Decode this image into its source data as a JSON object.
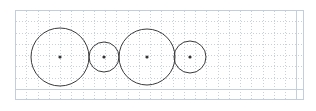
{
  "figure": {
    "title": "",
    "background_color": "#ffffff",
    "plot_area": {
      "x": 15,
      "y": 10,
      "width": 288,
      "height": 89
    }
  },
  "grid": {
    "visible": true,
    "style": "dotted",
    "color": "#b9c6d6",
    "border_color": "#c3cedc",
    "spacing": 11.25,
    "line_width": 1
  },
  "chart_data": {
    "type": "scatter",
    "title": "",
    "xlabel": "",
    "ylabel": "",
    "grid": true,
    "legend_position": "none",
    "xlim": [
      0,
      25.6
    ],
    "ylim": [
      0,
      7.9
    ],
    "circles": [
      {
        "name": "circle-1",
        "cx": 60,
        "cy": 57,
        "r": 29,
        "grid_cx": 4.0,
        "grid_cy": 3.8,
        "grid_r": 2.58
      },
      {
        "name": "circle-2",
        "cx": 104,
        "cy": 57,
        "r": 15,
        "grid_cx": 7.9,
        "grid_cy": 3.8,
        "grid_r": 1.33
      },
      {
        "name": "circle-3",
        "cx": 147,
        "cy": 57,
        "r": 28,
        "grid_cx": 11.7,
        "grid_cy": 3.8,
        "grid_r": 2.49
      },
      {
        "name": "circle-4",
        "cx": 190,
        "cy": 57,
        "r": 16,
        "grid_cx": 15.6,
        "grid_cy": 3.8,
        "grid_r": 1.42
      }
    ],
    "centers": [
      {
        "name": "center-dot-1",
        "cx": 60,
        "cy": 57
      },
      {
        "name": "center-dot-2",
        "cx": 104,
        "cy": 57
      },
      {
        "name": "center-dot-3",
        "cx": 147,
        "cy": 57
      },
      {
        "name": "center-dot-4",
        "cx": 190,
        "cy": 57
      }
    ],
    "stroke_color": "#3a3a3a",
    "center_dot_color": "#333333",
    "stroke_width": 1,
    "center_dot_radius": 1.6
  }
}
